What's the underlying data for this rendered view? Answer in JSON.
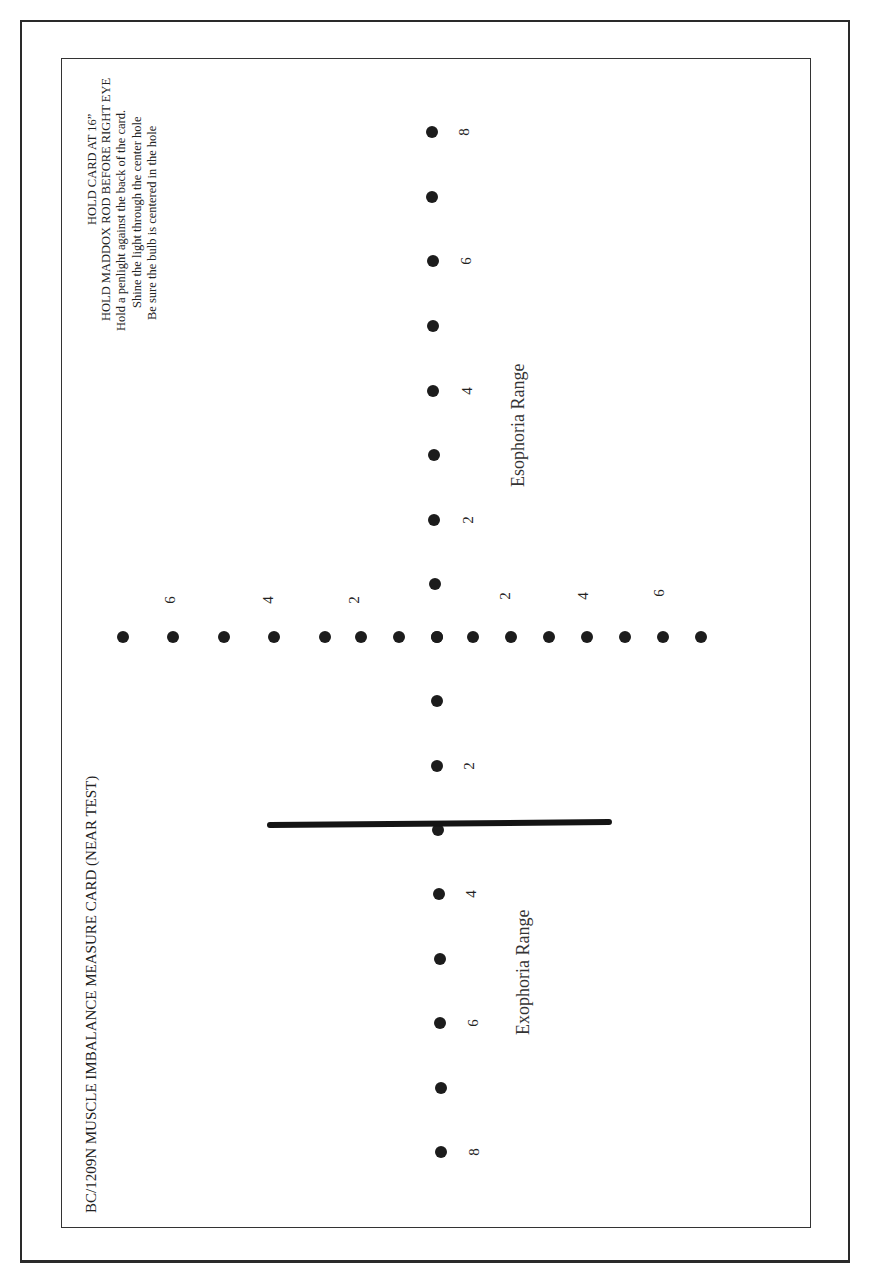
{
  "card": {
    "title": "BC/1209N MUSCLE IMBALANCE MEASURE CARD (NEAR TEST)",
    "instructions": [
      "HOLD CARD AT 16”",
      "HOLD MADDOX ROD BEFORE RIGHT EYE",
      "Hold a penlight against the back of the card.",
      "Shine the light through the center hole",
      "Be sure the bulb is centered in the hole"
    ],
    "esophoria_label": "Esophoria Range",
    "exophoria_label": "Exophoria Range",
    "colors": {
      "ink": "#1c1c1c",
      "paper": "#ffffff",
      "frame": "#2a2a2a"
    }
  },
  "horizontal_row": {
    "y": 637,
    "dots_x": [
      123,
      173,
      224,
      274,
      325,
      361,
      399,
      437,
      473,
      511,
      549,
      587,
      625,
      663,
      701
    ],
    "labels": [
      {
        "text": "6",
        "x": 170,
        "y": 600
      },
      {
        "text": "4",
        "x": 268,
        "y": 600
      },
      {
        "text": "2",
        "x": 354,
        "y": 600
      },
      {
        "text": "2",
        "x": 505,
        "y": 596
      },
      {
        "text": "4",
        "x": 583,
        "y": 596
      },
      {
        "text": "6",
        "x": 659,
        "y": 593
      }
    ]
  },
  "vertical_column": {
    "dots": [
      {
        "x": 432,
        "y": 132
      },
      {
        "x": 432,
        "y": 197
      },
      {
        "x": 433,
        "y": 261
      },
      {
        "x": 433,
        "y": 326
      },
      {
        "x": 433,
        "y": 391
      },
      {
        "x": 434,
        "y": 455
      },
      {
        "x": 434,
        "y": 520
      },
      {
        "x": 435,
        "y": 584
      },
      {
        "x": 437,
        "y": 637
      },
      {
        "x": 437,
        "y": 701
      },
      {
        "x": 437,
        "y": 766
      },
      {
        "x": 438,
        "y": 830
      },
      {
        "x": 439,
        "y": 894
      },
      {
        "x": 440,
        "y": 959
      },
      {
        "x": 440,
        "y": 1023
      },
      {
        "x": 441,
        "y": 1088
      },
      {
        "x": 441,
        "y": 1152
      }
    ],
    "labels": [
      {
        "text": "8",
        "x": 464,
        "y": 132
      },
      {
        "text": "6",
        "x": 466,
        "y": 261
      },
      {
        "text": "4",
        "x": 467,
        "y": 391
      },
      {
        "text": "2",
        "x": 468,
        "y": 520
      },
      {
        "text": "2",
        "x": 469,
        "y": 766
      },
      {
        "text": "4",
        "x": 471,
        "y": 894
      },
      {
        "text": "6",
        "x": 473,
        "y": 1023
      },
      {
        "text": "8",
        "x": 474,
        "y": 1152
      }
    ]
  },
  "cross_bar": {
    "x": 267,
    "y": 825,
    "length": 345,
    "angle_deg": -0.5
  }
}
